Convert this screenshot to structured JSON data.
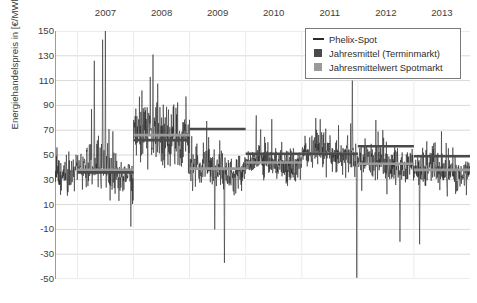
{
  "axes": {
    "ylabel": "Energiehandelspreis in [€/MWh]",
    "xlabel": "",
    "yticks": [
      "150",
      "130",
      "110",
      "90",
      "70",
      "50",
      "30",
      "10",
      "-10",
      "-30",
      "-50"
    ],
    "xticks": [
      "2007",
      "2008",
      "2009",
      "2010",
      "2011",
      "2012",
      "2013"
    ]
  },
  "legend": {
    "items": [
      {
        "label": "Phelix-Spot",
        "key": "line",
        "color": "#2b2b2b"
      },
      {
        "label": "Jahresmittel (Terminmarkt)",
        "key": "square-dark",
        "color": "#4a4a4a"
      },
      {
        "label": "Jahresmittelwert Spotmarkt",
        "key": "square-light",
        "color": "#9a9a9a"
      }
    ]
  },
  "colors": {
    "spot_series": "#1f1f1f",
    "terminmarkt": "#4a4a4a",
    "spot_average": "#9a9a9a",
    "gridline": "#d9d9d9",
    "axis": "#9c9c9c",
    "text": "#3d3d3d"
  },
  "chart_data": {
    "type": "line",
    "title": "",
    "xlabel": "",
    "ylabel": "Energiehandelspreis in [€/MWh]",
    "ylim": [
      -50,
      150
    ],
    "xlim": [
      2006.6,
      2014.0
    ],
    "grid": true,
    "legend_position": "top-right",
    "yticks": [
      150,
      130,
      110,
      90,
      70,
      50,
      30,
      10,
      -10,
      -30,
      -50
    ],
    "xticks": [
      2007,
      2008,
      2009,
      2010,
      2011,
      2012,
      2013
    ],
    "series": [
      {
        "name": "Phelix-Spot",
        "type": "line",
        "color": "#1f1f1f",
        "description": "Hochfrequente taegliche Spotpreis-Zeitreihe mit starker Volatilitaet",
        "annual_min": [
          -10,
          -15,
          -37,
          -20,
          -12,
          -50,
          -12
        ],
        "annual_max": [
          150,
          131,
          87,
          77,
          82,
          110,
          72
        ],
        "notable_peaks": [
          {
            "year": 2007.5,
            "value": 150
          },
          {
            "year": 2007.45,
            "value": 143
          },
          {
            "year": 2007.3,
            "value": 126
          },
          {
            "year": 2008.35,
            "value": 131
          },
          {
            "year": 2008.3,
            "value": 113
          },
          {
            "year": 2008.15,
            "value": 102
          },
          {
            "year": 2011.9,
            "value": 110
          }
        ],
        "notable_troughs": [
          {
            "year": 2009.45,
            "value": -10
          },
          {
            "year": 2009.62,
            "value": -37
          },
          {
            "year": 2011.98,
            "value": -50
          },
          {
            "year": 2012.75,
            "value": -20
          },
          {
            "year": 2013.1,
            "value": -22
          }
        ]
      },
      {
        "name": "Jahresmittel (Terminmarkt)",
        "type": "step",
        "color": "#4a4a4a",
        "categories": [
          2007,
          2008,
          2009,
          2010,
          2011,
          2012,
          2013
        ],
        "values": [
          36,
          62,
          71,
          51,
          51,
          57,
          49
        ]
      },
      {
        "name": "Jahresmittelwert Spotmarkt",
        "type": "step",
        "color": "#9a9a9a",
        "categories": [
          2007,
          2008,
          2009,
          2010,
          2011,
          2012,
          2013
        ],
        "values": [
          38,
          66,
          39,
          44,
          51,
          43,
          38
        ]
      }
    ]
  }
}
